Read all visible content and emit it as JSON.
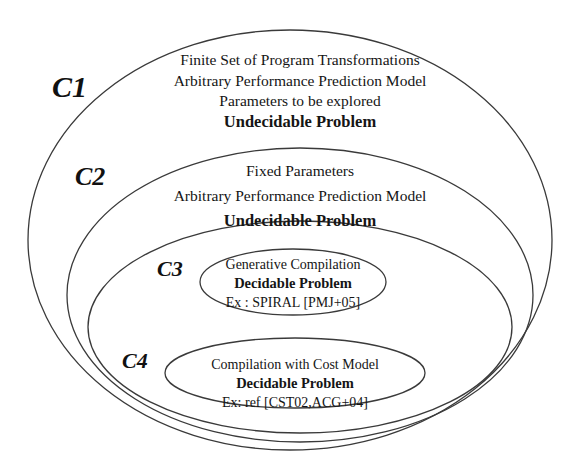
{
  "diagram": {
    "type": "nested-ellipse-venn",
    "background_color": "#ffffff",
    "stroke_color": "#3a3a3a",
    "text_color": "#151515",
    "sets": [
      {
        "id": "C1",
        "label": "C1",
        "lines": [
          "Finite Set of Program Transformations",
          "Arbitrary Performance Prediction Model",
          "Parameters to be explored",
          "Undecidable Problem"
        ],
        "bold_lines": [
          "Undecidable Problem"
        ],
        "shape": {
          "cx": 290,
          "cy": 240,
          "rx": 262,
          "ry": 210
        }
      },
      {
        "id": "C2",
        "label": "C2",
        "lines": [
          "Fixed Parameters",
          "Arbitrary Performance Prediction Model",
          "Undecidable Problem"
        ],
        "bold_lines": [
          "Undecidable Problem"
        ],
        "shape": {
          "cx": 300,
          "cy": 295,
          "rx": 233,
          "ry": 147
        }
      },
      {
        "id": "C3",
        "label": "C3",
        "lines": [
          "Generative Compilation",
          "Decidable Problem",
          "Ex : SPIRAL [PMJ+05]"
        ],
        "bold_lines": [
          "Decidable Problem"
        ],
        "shape": {
          "cx": 293,
          "cy": 282,
          "rx": 93,
          "ry": 33
        },
        "outer_shape": {
          "cx": 300,
          "cy": 327,
          "rx": 212,
          "ry": 106
        }
      },
      {
        "id": "C4",
        "label": "C4",
        "lines": [
          "Compilation with Cost Model",
          "Decidable Problem",
          "Ex: ref [CST02,ACG+04]"
        ],
        "bold_lines": [
          "Decidable Problem"
        ],
        "shape": {
          "cx": 295,
          "cy": 373,
          "rx": 130,
          "ry": 35
        }
      }
    ]
  }
}
